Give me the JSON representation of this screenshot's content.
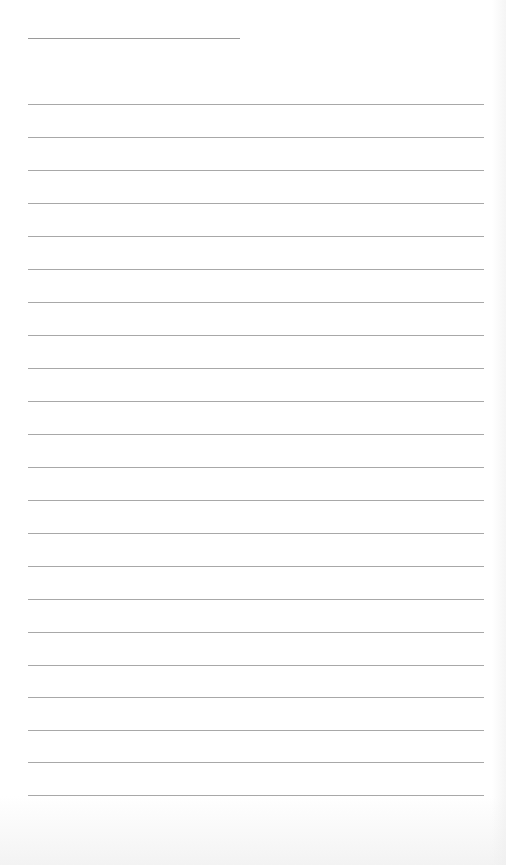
{
  "page": {
    "type": "blank lined writing sheet",
    "background_color": "#ffffff",
    "rule_color": "#a8a8a8",
    "header_rule": {
      "x": 28,
      "y": 38,
      "width": 212
    },
    "rules": {
      "x": 28,
      "width": 456,
      "count": 22,
      "y_positions": [
        104,
        137,
        170,
        203,
        236,
        269,
        302,
        335,
        368,
        401,
        434,
        467,
        500,
        533,
        566,
        599,
        632,
        665,
        697,
        730,
        762,
        795
      ]
    }
  }
}
